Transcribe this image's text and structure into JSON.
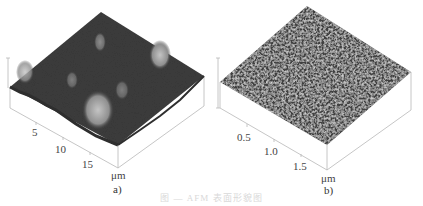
{
  "figure": {
    "caption": "图 — AFM 表面形貌图",
    "panels": [
      {
        "id": "a",
        "label": "a)",
        "unit": "μm",
        "axis_ticks": [
          "5",
          "10",
          "15"
        ],
        "surface_color": "#3d3d3d",
        "peak_color": "#b5b5b5"
      },
      {
        "id": "b",
        "label": "b)",
        "unit": "μm",
        "axis_ticks": [
          "0.5",
          "1.0",
          "1.5"
        ],
        "surface_color": "#4a4a4a",
        "peak_color": "#9a9a9a"
      }
    ]
  }
}
